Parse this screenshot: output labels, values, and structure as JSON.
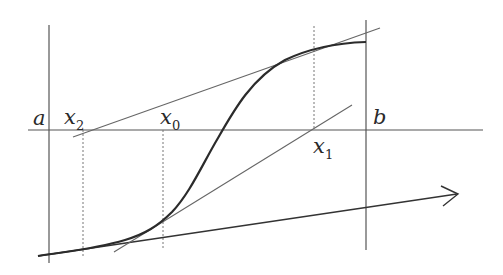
{
  "diagram": {
    "type": "newton-method-illustration",
    "colors": {
      "background": "#ffffff",
      "axis": "#555555",
      "curve": "#2b2b2b",
      "tangent": "#666666",
      "dotted": "#777777",
      "arrow": "#333333",
      "text": "#2a2a2a"
    },
    "labels": {
      "a": {
        "base": "a",
        "sub": ""
      },
      "b": {
        "base": "b",
        "sub": ""
      },
      "x0": {
        "base": "x",
        "sub": "0"
      },
      "x1": {
        "base": "x",
        "sub": "1"
      },
      "x2": {
        "base": "x",
        "sub": "2"
      }
    },
    "elements": [
      "horizontal-axis",
      "vertical-line-a",
      "vertical-line-b",
      "dotted-guide-x2",
      "dotted-guide-x0",
      "dotted-guide-x1",
      "function-curve",
      "tangent-line-upper",
      "tangent-line-middle",
      "arrow-line"
    ]
  }
}
